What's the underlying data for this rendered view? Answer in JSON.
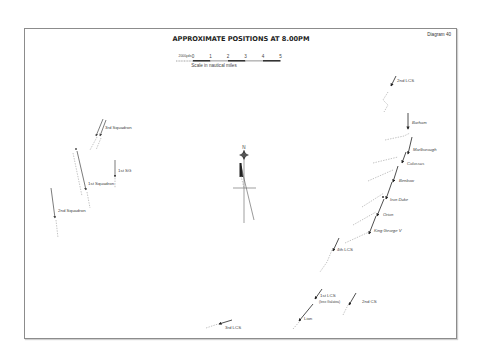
{
  "diagram": {
    "title": "APPROXIMATE POSITIONS AT 8.00PM",
    "number_label": "Diagram 40",
    "scale": {
      "unit_left": "2000yds",
      "ticks": [
        "0",
        "1",
        "2",
        "3",
        "4",
        "5"
      ],
      "caption": "Scale in nautical miles"
    },
    "compass": {
      "north_label": "N"
    },
    "units": {
      "british": [
        {
          "id": "2nd-lcs",
          "label": "2nd LCS"
        },
        {
          "id": "barham",
          "label": "Barham"
        },
        {
          "id": "marlborough",
          "label": "Marlborough"
        },
        {
          "id": "colossus",
          "label": "Colossus"
        },
        {
          "id": "benbow",
          "label": "Benbow"
        },
        {
          "id": "iron-duke",
          "label": "Iron Duke"
        },
        {
          "id": "orion",
          "label": "Orion"
        },
        {
          "id": "king-george-v",
          "label": "King George V"
        },
        {
          "id": "4th-lcs",
          "label": "4th LCS"
        },
        {
          "id": "1st-lcs",
          "label": "1st LCS",
          "sublabel": "(less Galatea)"
        },
        {
          "id": "lion",
          "label": "Lion"
        },
        {
          "id": "2nd-cs",
          "label": "2nd CS"
        },
        {
          "id": "3rd-lcs",
          "label": "3rd LCS"
        }
      ],
      "german": [
        {
          "id": "3rd-squadron",
          "label": "3rd Squadron"
        },
        {
          "id": "1st-sg",
          "label": "1st SG"
        },
        {
          "id": "1st-squadron",
          "label": "1st Squadron"
        },
        {
          "id": "2nd-squadron",
          "label": "2nd Squadron"
        }
      ]
    },
    "colors": {
      "frame": "#8c8c8c",
      "ink": "#222222",
      "trail": "#9a9a9a"
    }
  }
}
